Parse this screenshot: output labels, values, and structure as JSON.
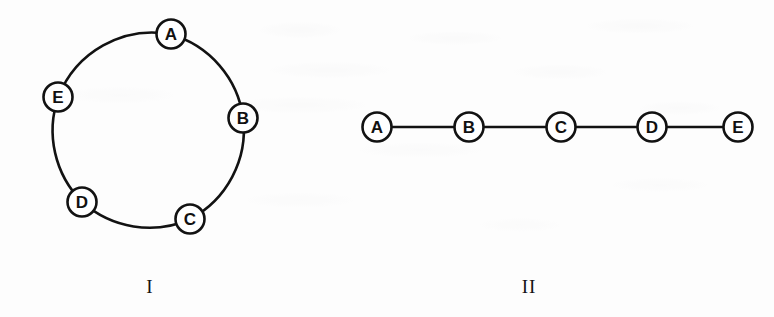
{
  "figure": {
    "background_color": "#fdfdfd",
    "ink_color": "#121212",
    "node_fill_color": "#ffffff",
    "diagrams": [
      {
        "id": "diagram-i",
        "caption": "I",
        "type": "cycle-graph",
        "caption_x": 150,
        "caption_y": 276,
        "layout": {
          "center_x": 148,
          "center_y": 127,
          "radius": 101,
          "node_radius": 14.5
        },
        "nodes": [
          {
            "label": "A",
            "x": 171,
            "y": 34
          },
          {
            "label": "B",
            "x": 243,
            "y": 118
          },
          {
            "label": "C",
            "x": 190,
            "y": 219
          },
          {
            "label": "D",
            "x": 82,
            "y": 202
          },
          {
            "label": "E",
            "x": 58,
            "y": 97
          }
        ],
        "edges": [
          {
            "from": "A",
            "to": "B"
          },
          {
            "from": "B",
            "to": "C"
          },
          {
            "from": "C",
            "to": "D"
          },
          {
            "from": "D",
            "to": "E"
          },
          {
            "from": "E",
            "to": "A"
          }
        ]
      },
      {
        "id": "diagram-ii",
        "caption": "II",
        "type": "path-graph",
        "caption_x": 529,
        "caption_y": 276,
        "layout": {
          "baseline_y": 127,
          "node_radius": 14.5
        },
        "nodes": [
          {
            "label": "A",
            "x": 377,
            "y": 127
          },
          {
            "label": "B",
            "x": 469,
            "y": 127
          },
          {
            "label": "C",
            "x": 561,
            "y": 127
          },
          {
            "label": "D",
            "x": 652,
            "y": 127
          },
          {
            "label": "E",
            "x": 738,
            "y": 127
          }
        ],
        "edges": [
          {
            "from": "A",
            "to": "B"
          },
          {
            "from": "B",
            "to": "C"
          },
          {
            "from": "C",
            "to": "D"
          },
          {
            "from": "D",
            "to": "E"
          }
        ]
      }
    ]
  }
}
